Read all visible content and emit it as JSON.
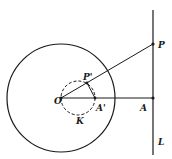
{
  "diagram": {
    "labels": {
      "O": "O",
      "P": "P",
      "P_prime": "P'",
      "A": "A",
      "A_prime": "A'",
      "K": "K",
      "L": "L"
    },
    "elements": [
      {
        "type": "circle",
        "name": "reference-circle",
        "style": "solid"
      },
      {
        "type": "circle",
        "name": "inverse-circle-K",
        "style": "dashed"
      },
      {
        "type": "line",
        "name": "line-L",
        "style": "solid"
      },
      {
        "type": "segment",
        "name": "ray-OP",
        "from": "O",
        "to": "P"
      },
      {
        "type": "segment",
        "name": "segment-OA",
        "from": "O",
        "to": "A"
      },
      {
        "type": "segment",
        "name": "segment-P'A'",
        "from": "P'",
        "to": "A'"
      }
    ],
    "colors": {
      "stroke": "#1a1a1a",
      "background": "#ffffff"
    }
  }
}
